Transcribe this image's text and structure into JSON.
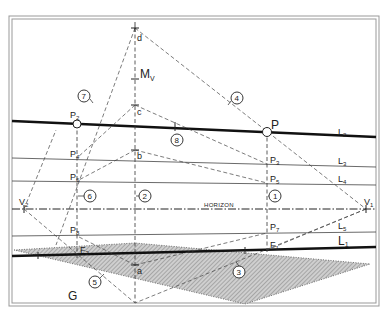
{
  "diagram": {
    "horizon_label": "HORIZON",
    "ground_label": "G",
    "measuring_label": "M",
    "measuring_sub": "V",
    "points": {
      "d": "d",
      "c": "c",
      "b": "b",
      "a": "a",
      "P": "P",
      "P1_sub": "1",
      "P2": "P",
      "P2_sub": "2",
      "P3": "P",
      "P3_sub": "3",
      "P4": "P",
      "P4_sub": "4",
      "P5": "P",
      "P5_sub": "5",
      "P6": "P",
      "P6_sub": "6",
      "P7": "P",
      "P7_sub": "7",
      "P8": "P",
      "P8_sub": "8",
      "F1": "F",
      "F1_sub": "1",
      "F2": "F",
      "F2_sub": "2",
      "V1": "V",
      "V1_sub": "1",
      "V2": "V",
      "V2_sub": "2"
    },
    "lines": {
      "L1": "L",
      "L1_sub": "1",
      "L2": "L",
      "L2_sub": "2",
      "L3": "L",
      "L3_sub": "3",
      "L4": "L",
      "L4_sub": "4",
      "L5": "L",
      "L5_sub": "5"
    },
    "step_markers": [
      "1",
      "2",
      "3",
      "4",
      "5",
      "6",
      "7",
      "8"
    ],
    "colors": {
      "ink": "#222222",
      "frame": "#888888",
      "hatch": "#9a9a9a"
    }
  }
}
